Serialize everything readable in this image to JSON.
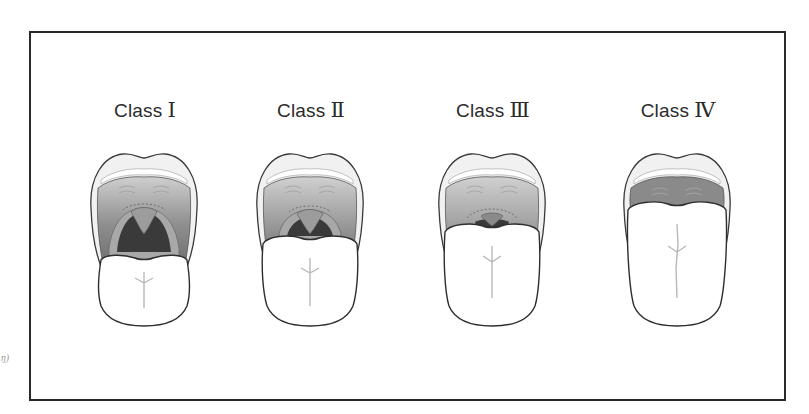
{
  "figure": {
    "side_mark": "ŋ)",
    "classes": [
      {
        "prefix": "Class",
        "numeral": "Ⅰ",
        "visible_structures": "soft palate, uvula, fauces, pillars"
      },
      {
        "prefix": "Class",
        "numeral": "Ⅱ",
        "visible_structures": "soft palate, uvula, fauces"
      },
      {
        "prefix": "Class",
        "numeral": "Ⅲ",
        "visible_structures": "soft palate, base of uvula"
      },
      {
        "prefix": "Class",
        "numeral": "Ⅳ",
        "visible_structures": "hard palate only"
      }
    ]
  },
  "colors": {
    "frame": "#2a2a2a",
    "outline": "#3a3a3a",
    "lip": "#efefef",
    "palate_dark": "#7c7c7c",
    "palate_light": "#bdbdbd",
    "throat": "#3c3c3c",
    "tongue": "#ffffff"
  }
}
